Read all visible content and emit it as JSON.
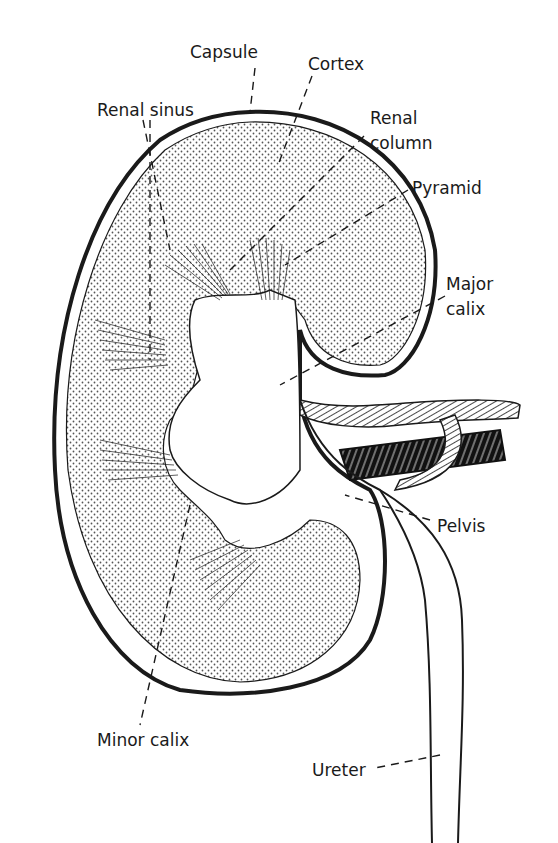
{
  "diagram": {
    "colors": {
      "ink": "#1a1a1a",
      "fill": "#ffffff",
      "stipple": "#555555"
    },
    "labels": {
      "capsule": "Capsule",
      "cortex": "Cortex",
      "renal_sinus": "Renal sinus",
      "renal_column_1": "Renal",
      "renal_column_2": "column",
      "pyramid": "Pyramid",
      "major_calix_1": "Major",
      "major_calix_2": "calix",
      "pelvis": "Pelvis",
      "minor_calix": "Minor calix",
      "ureter": "Ureter"
    }
  }
}
